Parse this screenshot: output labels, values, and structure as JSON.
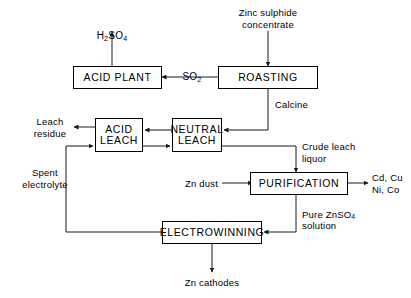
{
  "diagram": {
    "line_color": "#1a1a1a",
    "box_fill": "#ffffff",
    "text_color": "#000000",
    "processes": [
      {
        "id": "acid-plant",
        "label": "ACID PLANT"
      },
      {
        "id": "roasting",
        "label": "ROASTING"
      },
      {
        "id": "acid-leach",
        "label": "ACID\nLEACH"
      },
      {
        "id": "neutral-leach",
        "label": "NEUTRAL\nLEACH"
      },
      {
        "id": "purification",
        "label": "PURIFICATION"
      },
      {
        "id": "electrowinning",
        "label": "ELECTROWINNING"
      }
    ],
    "streams": {
      "feed": "Zinc  sulphide\nconcentrate",
      "acid_product": "H2SO4",
      "acid_product_pre": "H",
      "acid_product_sub1": "2",
      "acid_product_mid": "SO",
      "acid_product_sub2": "4",
      "so2": "SO",
      "so2_sub": "2",
      "calcine": "Calcine",
      "leach_residue": "Leach\nresidue",
      "spent_electrolyte": "Spent\nelectrolyte",
      "crude_leach": "Crude leach\nliquor",
      "zn_dust": "Zn dust",
      "impurities": "Cd, Cu\nNi, Co",
      "pure_solution_pre": "Pure  ZnSO",
      "pure_solution_sub": "4",
      "pure_solution_end": "\nsolution",
      "zn_cathodes": "Zn  cathodes"
    }
  }
}
